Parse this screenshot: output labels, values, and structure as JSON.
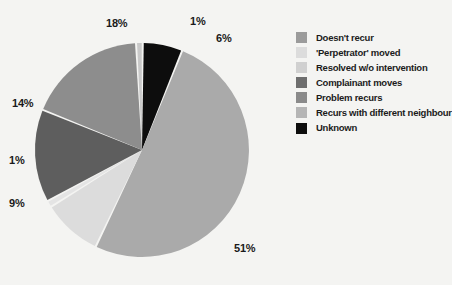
{
  "background_color": "#f4f4f2",
  "chart_data": {
    "type": "pie",
    "title": "",
    "subtitle": "",
    "xlabel": "",
    "ylabel": "",
    "legend_position": "right",
    "grid": false,
    "unit": "%",
    "categories": [
      "Doesn't recur",
      "'Perpetrator' moved",
      "Resolved w/o intervention",
      "Complainant moves",
      "Problem recurs",
      "Recurs with different neighbour",
      "Unknown"
    ],
    "values": [
      51,
      1,
      9,
      14,
      18,
      1,
      6
    ],
    "colors": [
      "#aaaaaa",
      "#e4e4e4",
      "#dcdcdc",
      "#5e5e5e",
      "#8d8d8d",
      "#c9c9c9",
      "#0d0d0d"
    ],
    "slices": [
      {
        "label": "Doesn't recur",
        "value": 51,
        "display": "51%",
        "color": "#aaaaaa"
      },
      {
        "label": "'Perpetrator' moved",
        "value": 1,
        "display": "1%",
        "color": "#e4e4e4"
      },
      {
        "label": "Resolved w/o intervention",
        "value": 9,
        "display": "9%",
        "color": "#dcdcdc"
      },
      {
        "label": "Complainant moves",
        "value": 14,
        "display": "14%",
        "color": "#5e5e5e"
      },
      {
        "label": "Problem recurs",
        "value": 18,
        "display": "18%",
        "color": "#8d8d8d"
      },
      {
        "label": "Recurs with different neighbour",
        "value": 1,
        "display": "1%",
        "color": "#c9c9c9"
      },
      {
        "label": "Unknown",
        "value": 6,
        "display": "6%",
        "color": "#0d0d0d"
      }
    ]
  },
  "pie": {
    "center_x": 142,
    "center_y": 150,
    "radius": 107,
    "separator_color": "#f4f4f2",
    "data_labels": [
      {
        "text": "18%",
        "x": 106,
        "y": 18
      },
      {
        "text": "1%",
        "x": 190,
        "y": 16
      },
      {
        "text": "6%",
        "x": 216,
        "y": 33
      },
      {
        "text": "14%",
        "x": 12,
        "y": 98
      },
      {
        "text": "1%",
        "x": 9,
        "y": 155
      },
      {
        "text": "9%",
        "x": 9,
        "y": 198
      },
      {
        "text": "51%",
        "x": 234,
        "y": 243
      }
    ]
  },
  "legend": {
    "items": [
      {
        "label": "Doesn't recur",
        "color": "#9b9b9b"
      },
      {
        "label": "'Perpetrator' moved",
        "color": "#dcdcdc"
      },
      {
        "label": "Resolved w/o intervention",
        "color": "#d0d0d0"
      },
      {
        "label": "Complainant moves",
        "color": "#6e6e6e"
      },
      {
        "label": "Problem recurs",
        "color": "#8a8a8a"
      },
      {
        "label": "Recurs with different neighbour",
        "color": "#b5b5b5"
      },
      {
        "label": "Unknown",
        "color": "#0d0d0d"
      }
    ]
  }
}
